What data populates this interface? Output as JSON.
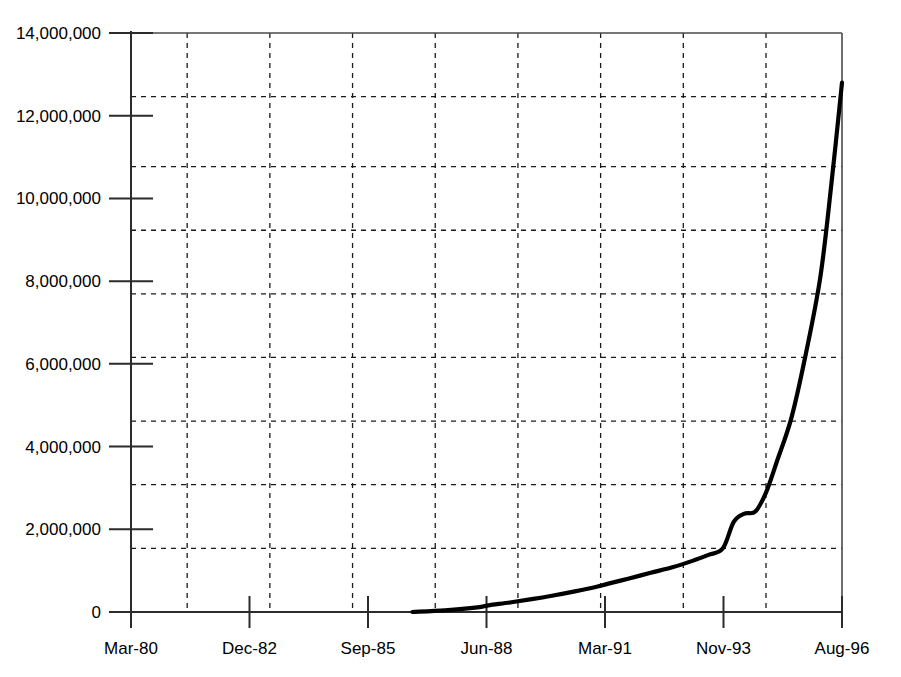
{
  "chart_data": {
    "type": "line",
    "title": "",
    "subtitle": "",
    "xlabel": "",
    "ylabel": "",
    "grid": true,
    "legend": false,
    "legend_position": "none",
    "xlim": [
      "Mar-80",
      "Aug-96"
    ],
    "ylim": [
      0,
      14000000
    ],
    "y_ticks": [
      0,
      2000000,
      4000000,
      6000000,
      8000000,
      10000000,
      12000000,
      14000000
    ],
    "y_tick_labels": [
      "0",
      "2,000,000",
      "4,000,000",
      "6,000,000",
      "8,000,000",
      "10,000,000",
      "12,000,000",
      "14,000,000"
    ],
    "y_gridlines": [
      1540000,
      3080000,
      4615000,
      6155000,
      7690000,
      9230000,
      10770000,
      12460000
    ],
    "x_ticks": [
      "Mar-80",
      "Dec-82",
      "Sep-85",
      "Jun-88",
      "Mar-91",
      "Nov-93",
      "Aug-96"
    ],
    "x_tick_labels": [
      "Mar-80",
      "Dec-82",
      "Sep-85",
      "Jun-88",
      "Mar-91",
      "Nov-93",
      "Aug-96"
    ],
    "x_gridline_count": 9,
    "series": [
      {
        "name": "series-1",
        "color": "#000000",
        "x": [
          "Sep-86",
          "Jun-87",
          "Mar-88",
          "Jun-88",
          "Dec-88",
          "Jun-89",
          "Dec-89",
          "Jun-90",
          "Dec-90",
          "Mar-91",
          "Sep-91",
          "Mar-92",
          "Sep-92",
          "Mar-93",
          "Jul-93",
          "Nov-93",
          "Feb-94",
          "May-94",
          "Aug-94",
          "Nov-94",
          "Feb-95",
          "Jun-95",
          "Oct-95",
          "Feb-96",
          "May-96",
          "Aug-96"
        ],
        "values": [
          0,
          40000,
          110000,
          160000,
          230000,
          310000,
          400000,
          500000,
          610000,
          680000,
          810000,
          950000,
          1080000,
          1250000,
          1380000,
          1540000,
          2180000,
          2380000,
          2430000,
          2900000,
          3650000,
          4700000,
          6250000,
          8100000,
          10300000,
          12800000
        ]
      }
    ]
  },
  "axes": {
    "y_axis_name": "y-axis",
    "x_axis_name": "x-axis"
  }
}
